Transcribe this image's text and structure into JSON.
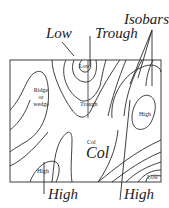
{
  "diagram": {
    "callouts": {
      "low": "Low",
      "trough": "Trough",
      "isobars": "Isobars",
      "high_left": "High",
      "high_right": "High"
    },
    "inner_labels": {
      "low_top": "Low",
      "ridge": "Ridge\nor\nwedge",
      "trough": "Trough",
      "high_right": "High",
      "col_small": "Col",
      "col_big": "Col",
      "high_bottom": "High",
      "low_bottom_right": "Low"
    },
    "colors": {
      "line": "#2a2a2a",
      "text": "#222222",
      "background": "#ffffff"
    }
  }
}
